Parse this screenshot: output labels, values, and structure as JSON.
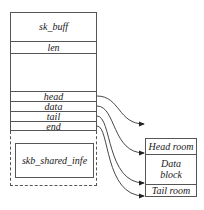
{
  "sk_buff": {
    "title": "sk_buff",
    "fields": {
      "len": "len",
      "head": "head",
      "data": "data",
      "tail": "tail",
      "end": "end"
    }
  },
  "shared_info": {
    "label": "skb_shared_infe"
  },
  "buffer": {
    "head_room": "Head room",
    "data_block_line1": "Data",
    "data_block_line2": "block",
    "tail_room": "Tail room"
  },
  "colors": {
    "line": "#555555",
    "text": "#1a1a1a",
    "arrow": "#222222"
  }
}
